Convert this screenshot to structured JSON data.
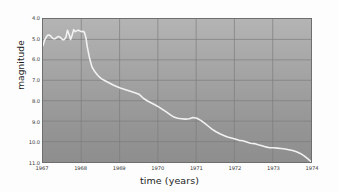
{
  "chart_data": {
    "type": "line",
    "title": "",
    "xlabel": "time (years)",
    "ylabel": "magnitude",
    "xlim": [
      1967.0,
      1974.0
    ],
    "ylim": [
      4.0,
      11.0
    ],
    "y_inverted": true,
    "grid": true,
    "legend": null,
    "xticks": [
      1967,
      1968,
      1969,
      1970,
      1971,
      1972,
      1973,
      1974
    ],
    "xticklabels": [
      "1967",
      "1968",
      "1969",
      "1970",
      "1971",
      "1972",
      "1973",
      "1974"
    ],
    "yticks": [
      4.0,
      5.0,
      6.0,
      7.0,
      8.0,
      9.0,
      10.0,
      11.0
    ],
    "yticklabels": [
      "4.0",
      "5.0",
      "6.0",
      "7.0",
      "8.0",
      "9.0",
      "10.0",
      "11.0"
    ],
    "series": [
      {
        "name": "magnitude",
        "color": "#f2f2f2",
        "x": [
          1967.0,
          1967.04,
          1967.08,
          1967.12,
          1967.16,
          1967.2,
          1967.24,
          1967.28,
          1967.32,
          1967.36,
          1967.4,
          1967.44,
          1967.48,
          1967.52,
          1967.56,
          1967.6,
          1967.64,
          1967.68,
          1967.72,
          1967.76,
          1967.8,
          1967.84,
          1967.88,
          1967.92,
          1967.96,
          1968.0,
          1968.04,
          1968.08,
          1968.12,
          1968.16,
          1968.22,
          1968.28,
          1968.36,
          1968.44,
          1968.52,
          1968.62,
          1968.72,
          1968.82,
          1968.92,
          1969.02,
          1969.12,
          1969.22,
          1969.32,
          1969.42,
          1969.52,
          1969.62,
          1969.72,
          1969.82,
          1969.92,
          1970.02,
          1970.12,
          1970.22,
          1970.32,
          1970.42,
          1970.52,
          1970.62,
          1970.72,
          1970.82,
          1970.92,
          1971.02,
          1971.12,
          1971.22,
          1971.32,
          1971.42,
          1971.52,
          1971.62,
          1971.72,
          1971.82,
          1971.92,
          1972.02,
          1972.12,
          1972.22,
          1972.32,
          1972.42,
          1972.52,
          1972.62,
          1972.72,
          1972.82,
          1972.92,
          1973.02,
          1973.12,
          1973.22,
          1973.32,
          1973.42,
          1973.52,
          1973.62,
          1973.72,
          1973.82,
          1973.92,
          1974.0
        ],
        "y": [
          5.3,
          5.05,
          4.9,
          4.8,
          4.78,
          4.83,
          4.92,
          4.97,
          4.96,
          4.9,
          4.86,
          4.88,
          4.95,
          5.02,
          5.0,
          4.88,
          4.55,
          4.75,
          5.0,
          4.8,
          4.52,
          4.62,
          4.58,
          4.55,
          4.58,
          4.62,
          4.6,
          4.65,
          4.9,
          5.4,
          5.95,
          6.35,
          6.6,
          6.78,
          6.92,
          7.02,
          7.12,
          7.22,
          7.3,
          7.38,
          7.44,
          7.5,
          7.56,
          7.62,
          7.7,
          7.88,
          8.0,
          8.1,
          8.2,
          8.3,
          8.42,
          8.55,
          8.68,
          8.8,
          8.86,
          8.88,
          8.9,
          8.88,
          8.82,
          8.86,
          8.96,
          9.1,
          9.25,
          9.4,
          9.52,
          9.62,
          9.7,
          9.78,
          9.82,
          9.88,
          9.94,
          9.96,
          10.02,
          10.08,
          10.1,
          10.16,
          10.2,
          10.26,
          10.3,
          10.3,
          10.32,
          10.34,
          10.36,
          10.4,
          10.44,
          10.5,
          10.58,
          10.7,
          10.85,
          10.98
        ]
      }
    ]
  }
}
